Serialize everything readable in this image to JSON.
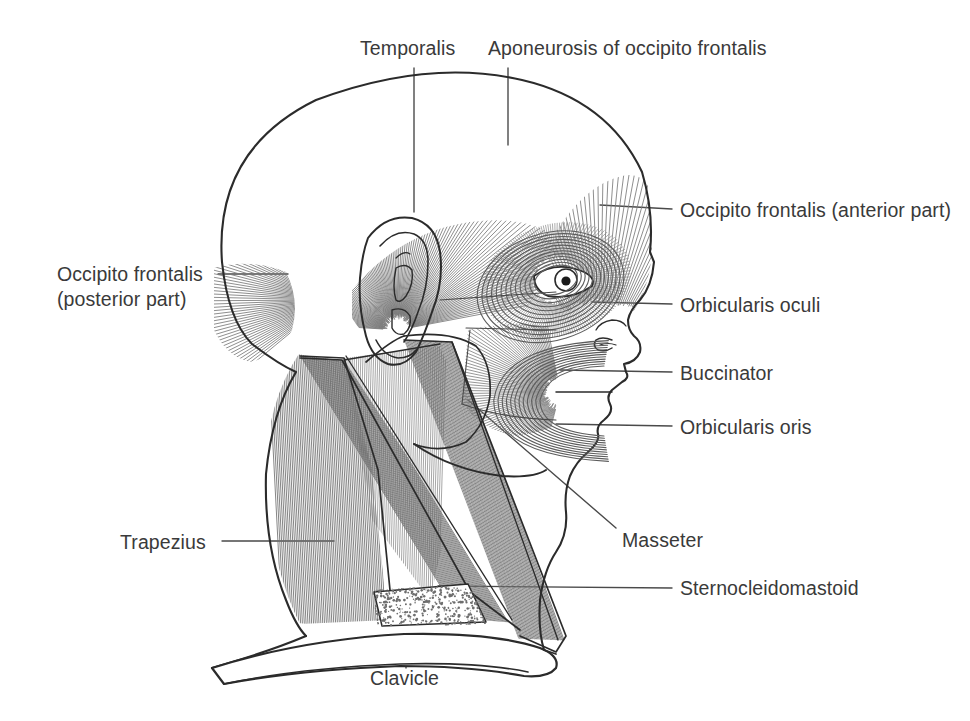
{
  "figure": {
    "background_color": "#ffffff",
    "ink_color": "#2b2b2b",
    "hatch_color": "#6e6e6e",
    "text_color": "#3a3a3a"
  },
  "labels": {
    "temporalis": "Temporalis",
    "aponeurosis": "Aponeurosis of occipito frontalis",
    "occipito_anterior": "Occipito frontalis (anterior part)",
    "occipito_posterior_line1": "Occipito frontalis",
    "occipito_posterior_line2": "(posterior part)",
    "orbicularis_oculi": "Orbicularis oculi",
    "buccinator": "Buccinator",
    "orbicularis_oris": "Orbicularis oris",
    "masseter": "Masseter",
    "trapezius": "Trapezius",
    "sternocleidomastoid": "Sternocleidomastoid",
    "clavicle": "Clavicle"
  },
  "structures": [
    {
      "name": "temporalis",
      "label": "Temporalis",
      "kind": "muscle",
      "leader": "vertical"
    },
    {
      "name": "aponeurosis-of-occipito-frontalis",
      "label": "Aponeurosis of occipito frontalis",
      "kind": "aponeurosis",
      "leader": "vertical"
    },
    {
      "name": "occipito-frontalis-anterior",
      "label": "Occipito frontalis (anterior part)",
      "kind": "muscle",
      "leader": "horizontal"
    },
    {
      "name": "occipito-frontalis-posterior",
      "label": "Occipito frontalis (posterior part)",
      "kind": "muscle",
      "leader": "horizontal"
    },
    {
      "name": "orbicularis-oculi",
      "label": "Orbicularis oculi",
      "kind": "muscle",
      "leader": "horizontal"
    },
    {
      "name": "buccinator",
      "label": "Buccinator",
      "kind": "muscle",
      "leader": "horizontal"
    },
    {
      "name": "orbicularis-oris",
      "label": "Orbicularis oris",
      "kind": "muscle",
      "leader": "horizontal"
    },
    {
      "name": "masseter",
      "label": "Masseter",
      "kind": "muscle",
      "leader": "diagonal"
    },
    {
      "name": "trapezius",
      "label": "Trapezius",
      "kind": "muscle",
      "leader": "horizontal"
    },
    {
      "name": "sternocleidomastoid",
      "label": "Sternocleidomastoid",
      "kind": "muscle",
      "leader": "horizontal"
    },
    {
      "name": "clavicle",
      "label": "Clavicle",
      "kind": "bone",
      "leader": "vertical"
    }
  ]
}
